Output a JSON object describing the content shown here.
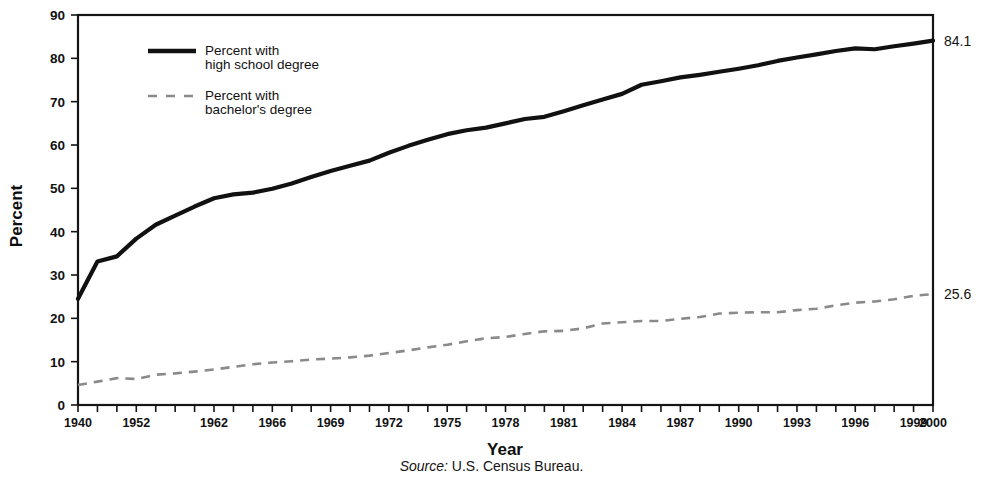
{
  "chart_data": {
    "type": "line",
    "title": "",
    "subtitle": "",
    "xlabel": "Year",
    "ylabel": "Percent",
    "source": "U.S. Census Bureau.",
    "source_prefix": "Source:",
    "ylim": [
      0,
      90
    ],
    "yticks": [
      0,
      10,
      20,
      30,
      40,
      50,
      60,
      70,
      80,
      90
    ],
    "xlim": [
      1940,
      2000
    ],
    "grid": false,
    "legend_position": "upper-left-inside",
    "xtick_labels": [
      "1940",
      "1952",
      "1962",
      "1966",
      "1969",
      "1972",
      "1975",
      "1978",
      "1981",
      "1984",
      "1987",
      "1990",
      "1993",
      "1996",
      "1999",
      "2000"
    ],
    "xtick_label_years": [
      1940,
      1952,
      1962,
      1966,
      1969,
      1972,
      1975,
      1978,
      1981,
      1984,
      1987,
      1990,
      1993,
      1996,
      1999,
      2000
    ],
    "x": [
      1940,
      1947,
      1950,
      1952,
      1957,
      1959,
      1960,
      1962,
      1964,
      1965,
      1966,
      1967,
      1968,
      1969,
      1970,
      1971,
      1972,
      1973,
      1974,
      1975,
      1976,
      1977,
      1978,
      1979,
      1980,
      1981,
      1982,
      1983,
      1984,
      1985,
      1986,
      1987,
      1988,
      1989,
      1990,
      1991,
      1992,
      1993,
      1994,
      1995,
      1996,
      1997,
      1998,
      1999,
      2000
    ],
    "series": [
      {
        "name": "Percent with high school degree",
        "legend_label": "Percent with\nhigh school degree",
        "style": "solid",
        "color": "#111111",
        "end_label": "84.1",
        "values": [
          24.5,
          33.1,
          34.3,
          38.4,
          41.6,
          43.7,
          45.8,
          47.7,
          48.6,
          49.0,
          49.9,
          51.1,
          52.6,
          54.0,
          55.2,
          56.4,
          58.2,
          59.8,
          61.2,
          62.5,
          63.4,
          64.0,
          65.0,
          66.0,
          66.5,
          67.8,
          69.2,
          70.5,
          71.8,
          73.9,
          74.7,
          75.6,
          76.2,
          76.9,
          77.6,
          78.4,
          79.4,
          80.2,
          80.9,
          81.7,
          82.3,
          82.1,
          82.8,
          83.4,
          84.1
        ]
      },
      {
        "name": "Percent with bachelor's degree",
        "legend_label": "Percent with\nbachelor's degree",
        "style": "dashed",
        "color": "#8a8a8a",
        "end_label": "25.6",
        "values": [
          4.6,
          5.4,
          6.2,
          6.0,
          7.0,
          7.3,
          7.7,
          8.2,
          8.8,
          9.4,
          9.8,
          10.1,
          10.5,
          10.7,
          11.0,
          11.4,
          12.0,
          12.6,
          13.3,
          13.9,
          14.7,
          15.4,
          15.7,
          16.4,
          17.0,
          17.1,
          17.7,
          18.8,
          19.1,
          19.4,
          19.4,
          19.9,
          20.3,
          21.1,
          21.3,
          21.4,
          21.4,
          21.9,
          22.2,
          23.0,
          23.6,
          23.9,
          24.4,
          25.2,
          25.6
        ]
      }
    ]
  },
  "legend": {
    "items": [
      {
        "line1": "Percent with",
        "line2": "high school degree",
        "style": "solid"
      },
      {
        "line1": "Percent with",
        "line2": "bachelor's degree",
        "style": "dashed"
      }
    ]
  },
  "colors": {
    "axis": "#151515",
    "high_school_line": "#111111",
    "bachelor_line": "#8a8a8a",
    "text": "#121212",
    "background": "#ffffff"
  }
}
